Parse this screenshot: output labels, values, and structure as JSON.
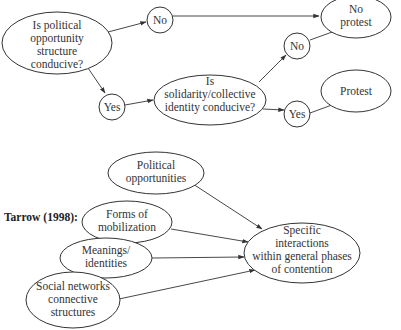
{
  "diagram": {
    "model1": {
      "q1": {
        "lines": [
          "Is political",
          "opportunity",
          "structure",
          "conducive?"
        ]
      },
      "no_top": {
        "label": "No"
      },
      "yes_left": {
        "label": "Yes"
      },
      "q2": {
        "lines": [
          "Is",
          "solidarity/collective",
          "identity conducive?"
        ]
      },
      "no_mid": {
        "label": "No"
      },
      "yes_bottom": {
        "label": "Yes"
      },
      "no_protest": {
        "lines": [
          "No",
          "protest"
        ]
      },
      "protest": {
        "label": "Protest"
      }
    },
    "model2": {
      "heading": "Tarrow (1998):",
      "political_opportunities": {
        "lines": [
          "Political",
          "opportunities"
        ]
      },
      "forms_of_mobilization": {
        "lines": [
          "Forms of",
          "mobilization"
        ]
      },
      "meanings_identities": {
        "lines": [
          "Meanings/",
          "identities"
        ]
      },
      "social_networks": {
        "lines": [
          "Social networks",
          "connective",
          "structures"
        ]
      },
      "specific_interactions": {
        "lines": [
          "Specific",
          "interactions",
          "within general phases",
          "of contention"
        ]
      }
    },
    "colors": {
      "stroke": "#333333",
      "text": "#333333",
      "background": "#ffffff"
    }
  }
}
